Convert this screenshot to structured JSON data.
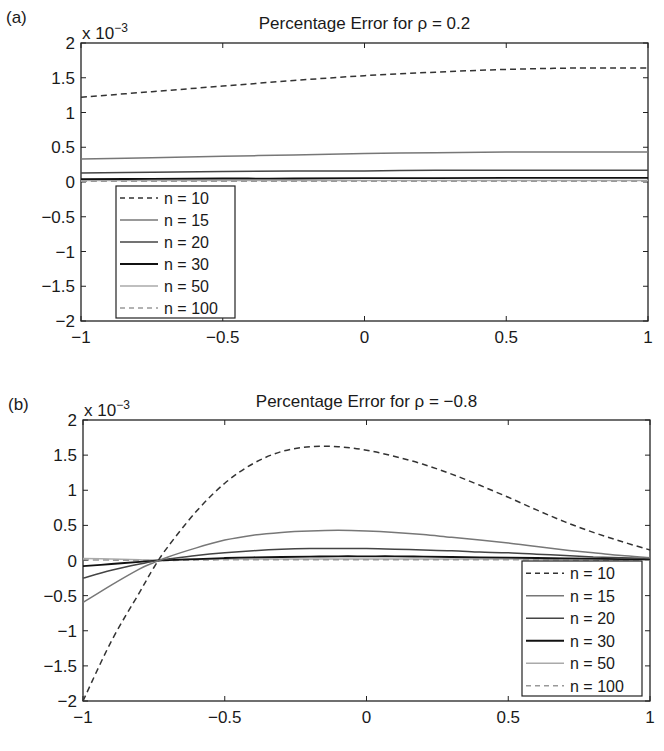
{
  "figure": {
    "panels": [
      {
        "label": "(a)",
        "title": "Percentage Error for ρ = 0.2",
        "exponent_label": "x 10",
        "exponent_power": "−3",
        "legend_position": "lower left"
      },
      {
        "label": "(b)",
        "title": "Percentage Error for ρ = −0.8",
        "exponent_label": "x 10",
        "exponent_power": "−3",
        "legend_position": "lower right"
      }
    ]
  },
  "chart_data": [
    {
      "type": "line",
      "title": "Percentage Error for ρ = 0.2",
      "panel_label": "(a)",
      "xlabel": "",
      "ylabel": "",
      "y_scale_note": "x 10^-3",
      "xlim": [
        -1,
        1
      ],
      "ylim": [
        -2,
        2
      ],
      "xticks": [
        "−1",
        "−0.5",
        "0",
        "0.5",
        "1"
      ],
      "yticks": [
        "2",
        "1.5",
        "1",
        "0.5",
        "0",
        "−0.5",
        "−1",
        "−1.5",
        "−2"
      ],
      "grid": false,
      "legend_position": "lower left",
      "x": [
        -1,
        -0.75,
        -0.5,
        -0.25,
        0,
        0.25,
        0.5,
        0.75,
        1
      ],
      "series": [
        {
          "name": "n = 10",
          "style": "dashed",
          "color": "#333333",
          "values": [
            1.22,
            1.3,
            1.38,
            1.46,
            1.53,
            1.58,
            1.62,
            1.64,
            1.64
          ]
        },
        {
          "name": "n = 15",
          "style": "solid",
          "color": "#777777",
          "values": [
            0.33,
            0.35,
            0.37,
            0.39,
            0.41,
            0.42,
            0.43,
            0.43,
            0.43
          ]
        },
        {
          "name": "n = 20",
          "style": "solid",
          "color": "#444444",
          "values": [
            0.13,
            0.14,
            0.15,
            0.16,
            0.16,
            0.17,
            0.17,
            0.17,
            0.17
          ]
        },
        {
          "name": "n = 30",
          "style": "solid",
          "color": "#111111",
          "values": [
            0.04,
            0.045,
            0.05,
            0.05,
            0.055,
            0.055,
            0.06,
            0.06,
            0.06
          ]
        },
        {
          "name": "n = 50",
          "style": "solid",
          "color": "#aaaaaa",
          "values": [
            0.02,
            0.02,
            0.02,
            0.02,
            0.02,
            0.02,
            0.02,
            0.02,
            0.02
          ]
        },
        {
          "name": "n = 100",
          "style": "dashed",
          "color": "#999999",
          "values": [
            0.01,
            0.01,
            0.01,
            0.01,
            0.01,
            0.01,
            0.01,
            0.01,
            0.01
          ]
        }
      ]
    },
    {
      "type": "line",
      "title": "Percentage Error for ρ = −0.8",
      "panel_label": "(b)",
      "xlabel": "",
      "ylabel": "",
      "y_scale_note": "x 10^-3",
      "xlim": [
        -1,
        1
      ],
      "ylim": [
        -2,
        2
      ],
      "xticks": [
        "−1",
        "−0.5",
        "0",
        "0.5",
        "1"
      ],
      "yticks": [
        "2",
        "1.5",
        "1",
        "0.5",
        "0",
        "−0.5",
        "−1",
        "−1.5",
        "−2"
      ],
      "grid": false,
      "legend_position": "lower right",
      "x": [
        -1,
        -0.9,
        -0.8,
        -0.75,
        -0.7,
        -0.6,
        -0.5,
        -0.4,
        -0.3,
        -0.2,
        -0.1,
        0,
        0.1,
        0.2,
        0.3,
        0.4,
        0.5,
        0.6,
        0.7,
        0.8,
        0.9,
        1
      ],
      "series": [
        {
          "name": "n = 10",
          "style": "dashed",
          "color": "#333333",
          "values": [
            -2.0,
            -1.15,
            -0.45,
            -0.1,
            0.2,
            0.7,
            1.1,
            1.38,
            1.55,
            1.62,
            1.62,
            1.57,
            1.48,
            1.37,
            1.23,
            1.07,
            0.9,
            0.72,
            0.55,
            0.4,
            0.27,
            0.15
          ]
        },
        {
          "name": "n = 15",
          "style": "solid",
          "color": "#777777",
          "values": [
            -0.6,
            -0.35,
            -0.12,
            -0.03,
            0.05,
            0.18,
            0.29,
            0.36,
            0.4,
            0.42,
            0.43,
            0.42,
            0.4,
            0.37,
            0.33,
            0.29,
            0.25,
            0.2,
            0.15,
            0.11,
            0.07,
            0.04
          ]
        },
        {
          "name": "n = 20",
          "style": "solid",
          "color": "#444444",
          "values": [
            -0.25,
            -0.14,
            -0.05,
            -0.01,
            0.02,
            0.07,
            0.11,
            0.14,
            0.16,
            0.17,
            0.17,
            0.17,
            0.16,
            0.15,
            0.14,
            0.12,
            0.11,
            0.09,
            0.07,
            0.05,
            0.04,
            0.03
          ]
        },
        {
          "name": "n = 30",
          "style": "solid",
          "color": "#111111",
          "values": [
            -0.08,
            -0.05,
            -0.02,
            -0.005,
            0.005,
            0.02,
            0.035,
            0.045,
            0.05,
            0.055,
            0.06,
            0.06,
            0.06,
            0.055,
            0.05,
            0.045,
            0.04,
            0.035,
            0.03,
            0.025,
            0.02,
            0.02
          ]
        },
        {
          "name": "n = 50",
          "style": "solid",
          "color": "#aaaaaa",
          "values": [
            0.03,
            0.02,
            0.01,
            0.005,
            0.01,
            0.015,
            0.02,
            0.02,
            0.02,
            0.02,
            0.02,
            0.02,
            0.02,
            0.02,
            0.02,
            0.02,
            0.02,
            0.02,
            0.015,
            0.015,
            0.01,
            0.01
          ]
        },
        {
          "name": "n = 100",
          "style": "dashed",
          "color": "#999999",
          "values": [
            0.01,
            0.005,
            0.0,
            0.0,
            0.0,
            0.005,
            0.01,
            0.01,
            0.01,
            0.01,
            0.01,
            0.01,
            0.01,
            0.01,
            0.01,
            0.01,
            0.01,
            0.01,
            0.01,
            0.005,
            0.005,
            0.005
          ]
        }
      ]
    }
  ]
}
